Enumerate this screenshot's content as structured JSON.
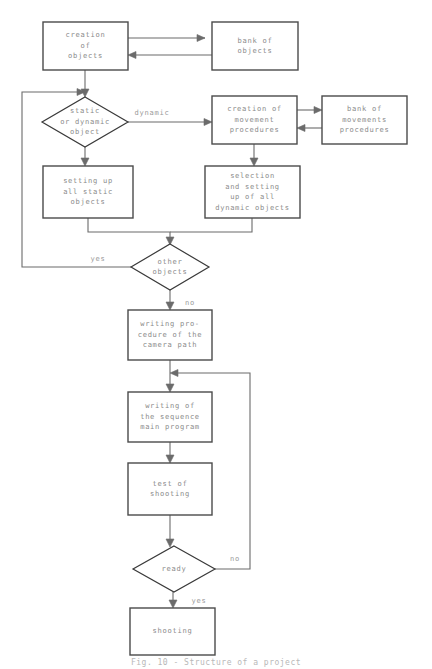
{
  "diagram": {
    "caption": "Fig. 10 - Structure of a project",
    "colors": {
      "background": "#ffffff",
      "box_stroke": "#4a4a4a",
      "diamond_stroke": "#3a3a3a",
      "edge_stroke": "#6b6b6b",
      "text": "#8a8a8a",
      "label_text": "#9a9a9a"
    },
    "nodes": [
      {
        "id": "creation-of-objects",
        "type": "process",
        "lines": [
          "creation",
          "of",
          "objects"
        ],
        "x": 43,
        "y": 22,
        "w": 85,
        "h": 48
      },
      {
        "id": "bank-of-objects",
        "type": "process",
        "lines": [
          "bank of",
          "objects"
        ],
        "x": 212,
        "y": 22,
        "w": 86,
        "h": 48
      },
      {
        "id": "static-or-dynamic-object",
        "type": "decision",
        "lines": [
          "static",
          "or dynamic",
          "object"
        ],
        "cx": 85,
        "cy": 122,
        "rx": 43,
        "ry": 25
      },
      {
        "id": "creation-of-movement-procedures",
        "type": "process",
        "lines": [
          "creation of",
          "movement",
          "procedures"
        ],
        "x": 212,
        "y": 96,
        "w": 85,
        "h": 48
      },
      {
        "id": "bank-of-movements-procedures",
        "type": "process",
        "lines": [
          "bank of",
          "movements",
          "procedures"
        ],
        "x": 322,
        "y": 96,
        "w": 85,
        "h": 48
      },
      {
        "id": "setting-up-all-static-objects",
        "type": "process",
        "lines": [
          "setting up",
          "all static",
          "objects"
        ],
        "x": 43,
        "y": 166,
        "w": 90,
        "h": 52
      },
      {
        "id": "selection-and-setting-up-of-all-dynamic-objects",
        "type": "process",
        "lines": [
          "selection",
          "and setting",
          "up of all",
          "dynamic objects"
        ],
        "x": 205,
        "y": 166,
        "w": 95,
        "h": 52
      },
      {
        "id": "other-objects",
        "type": "decision",
        "lines": [
          "other",
          "objects"
        ],
        "cx": 170,
        "cy": 267,
        "rx": 39,
        "ry": 23
      },
      {
        "id": "writing-procedure-of-the-camera-path",
        "type": "process",
        "lines": [
          "writing pro-",
          "cedure of the",
          "camera path"
        ],
        "x": 128,
        "y": 310,
        "w": 84,
        "h": 50
      },
      {
        "id": "writing-of-the-sequence-main-program",
        "type": "process",
        "lines": [
          "writing of",
          "the sequence",
          "main program"
        ],
        "x": 128,
        "y": 392,
        "w": 84,
        "h": 50
      },
      {
        "id": "test-of-shooting",
        "type": "process",
        "lines": [
          "test of",
          "shooting"
        ],
        "x": 128,
        "y": 463,
        "w": 84,
        "h": 52
      },
      {
        "id": "ready",
        "type": "decision",
        "lines": [
          "ready"
        ],
        "cx": 174,
        "cy": 569,
        "rx": 41,
        "ry": 23
      },
      {
        "id": "shooting",
        "type": "process",
        "lines": [
          "shooting"
        ],
        "x": 130,
        "y": 608,
        "w": 85,
        "h": 47
      }
    ],
    "edge_labels": [
      {
        "id": "label-dynamic",
        "text": "dynamic",
        "x": 152,
        "y": 113
      },
      {
        "id": "label-yes-other-objects",
        "text": "yes",
        "x": 98,
        "y": 259
      },
      {
        "id": "label-no-other-objects",
        "text": "no",
        "x": 190,
        "y": 303
      },
      {
        "id": "label-no-ready",
        "text": "no",
        "x": 235,
        "y": 559
      },
      {
        "id": "label-yes-ready",
        "text": "yes",
        "x": 199,
        "y": 601
      }
    ],
    "edges": [
      {
        "id": "edge-creation-to-bank",
        "from": "creation-of-objects",
        "to": "bank-of-objects",
        "d": "M128,38 L205,38",
        "arrow": "M205,38 L197,34.5 L197,41.5 Z"
      },
      {
        "id": "edge-bank-to-creation",
        "from": "bank-of-objects",
        "to": "creation-of-objects",
        "d": "M212,55 L136,55",
        "arrow": "M128,55 L136,51.5 L136,58.5 Z"
      },
      {
        "id": "edge-creation-to-decision",
        "from": "creation-of-objects",
        "to": "static-or-dynamic-object",
        "d": "M85,70 L85,90",
        "arrow": "M85,97 L81,89 L89,89 Z"
      },
      {
        "id": "edge-decision-to-movement",
        "from": "static-or-dynamic-object",
        "to": "creation-of-movement-procedures",
        "d": "M128,122 L205,122",
        "arrow": "M212,122 L204,118.5 L204,125.5 Z"
      },
      {
        "id": "edge-movement-to-bank-movements",
        "from": "creation-of-movement-procedures",
        "to": "bank-of-movements-procedures",
        "d": "M297,110 L315,110",
        "arrow": "M322,110 L314,106.5 L314,113.5 Z"
      },
      {
        "id": "edge-bank-movements-to-movement",
        "from": "bank-of-movements-procedures",
        "to": "creation-of-movement-procedures",
        "d": "M322,128 L304,128",
        "arrow": "M297,128 L305,124.5 L305,131.5 Z"
      },
      {
        "id": "edge-decision-to-static-setup",
        "from": "static-or-dynamic-object",
        "to": "setting-up-all-static-objects",
        "d": "M85,147 L85,159",
        "arrow": "M85,166 L81,158 L89,158 Z"
      },
      {
        "id": "edge-movement-to-selection",
        "from": "creation-of-movement-procedures",
        "to": "selection-and-setting-up-of-all-dynamic-objects",
        "d": "M254,144 L254,159",
        "arrow": "M254,166 L250,158 L258,158 Z"
      },
      {
        "id": "edge-static-setup-to-other",
        "from": "setting-up-all-static-objects",
        "to": "other-objects",
        "d": "M88,218 L88,232 L170,232 L170,238",
        "arrow": "M170,245 L166,237 L174,237 Z"
      },
      {
        "id": "edge-selection-to-other",
        "from": "selection-and-setting-up-of-all-dynamic-objects",
        "to": "other-objects",
        "d": "M252,218 L252,232 L170,232",
        "arrow": ""
      },
      {
        "id": "edge-other-yes-loop",
        "from": "other-objects",
        "to": "static-or-dynamic-object",
        "d": "M131,267 L22,267 L22,92 L78,92",
        "arrow": "M85,92 L77,88.5 L77,95.5 Z"
      },
      {
        "id": "edge-other-no-to-camera",
        "from": "other-objects",
        "to": "writing-procedure-of-the-camera-path",
        "d": "M170,290 L170,303",
        "arrow": "M170,310 L166,302 L174,302 Z"
      },
      {
        "id": "edge-camera-to-sequence",
        "from": "writing-procedure-of-the-camera-path",
        "to": "writing-of-the-sequence-main-program",
        "d": "M170,360 L170,385",
        "arrow": "M170,392 L166,384 L174,384 Z"
      },
      {
        "id": "edge-sequence-to-test",
        "from": "writing-of-the-sequence-main-program",
        "to": "test-of-shooting",
        "d": "M170,442 L170,456",
        "arrow": "M170,463 L166,455 L174,455 Z"
      },
      {
        "id": "edge-test-to-ready",
        "from": "test-of-shooting",
        "to": "ready",
        "d": "M170,515 L170,540",
        "arrow": "M170,547 L166,539 L174,539 Z"
      },
      {
        "id": "edge-ready-no-loop",
        "from": "ready",
        "to": "writing-procedure-of-the-camera-path",
        "d": "M215,569 L250,569 L250,373 L177,373",
        "arrow": "M170,373 L178,369.5 L178,376.5 Z"
      },
      {
        "id": "edge-ready-yes-to-shooting",
        "from": "ready",
        "to": "shooting",
        "d": "M173,592 L173,601",
        "arrow": "M173,608 L169,600 L177,600 Z"
      }
    ]
  }
}
